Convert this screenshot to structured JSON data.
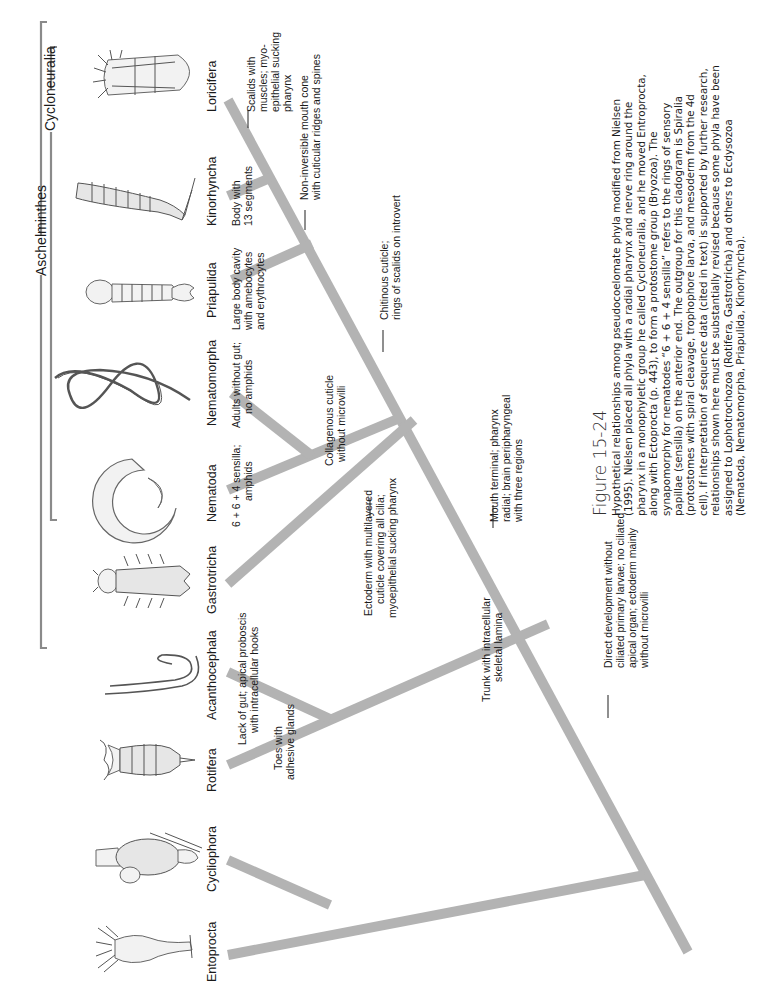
{
  "figure": {
    "number_label": "Figure 15-24",
    "caption_lines": [
      "Hypothetical relationships among pseudocoelomate phyla modified from Nielsen",
      "(1995). Nielsen placed all phyla with a radial pharynx and nerve ring around the",
      "pharynx in a monophyletic group he called Cycloneuralia, and he moved Entroprocta,",
      "along with Ectoprocta (p. 443), to form a protostome group (Bryozoa). The",
      "synapomorphy for nematodes “6 + 6 + 4 sensilla” refers to the rings of sensory",
      "papillae (sensilla) on the anterior end. The outgroup for this cladogram is Spiralia",
      "(protostomes with spiral cleavage, trophophore larva, and mesoderm from the 4d",
      "cell). If interpretation of sequence data (cited in text) is supported by further research,",
      "relationships shown here must be substantially revised because some phyla have been",
      "assigned to Lophotrochozoa (Rotifera, Gastrotricha) and others to Ecdysozoa",
      "(Nematoda, Nematomorpha, Priapulida, Kinorhyncha)."
    ]
  },
  "clades": {
    "aschelminthes": "Aschelminthes",
    "cycloneuralia": "Cycloneuralia"
  },
  "taxa": [
    {
      "name": "Entoprocta"
    },
    {
      "name": "Cycliophora"
    },
    {
      "name": "Rotifera"
    },
    {
      "name": "Acanthocephala"
    },
    {
      "name": "Gastrotricha"
    },
    {
      "name": "Nematoda"
    },
    {
      "name": "Nematomorpha"
    },
    {
      "name": "Priapulida"
    },
    {
      "name": "Kinorhyncha"
    },
    {
      "name": "Loricifera"
    }
  ],
  "characters": {
    "toes": [
      "Toes with",
      "adhesive glands"
    ],
    "lack_of_gut": [
      "Lack of gut; apical proboscis",
      "with intracellular hooks"
    ],
    "trunk": [
      "Trunk with intracellular",
      "skeletal lamina"
    ],
    "ectoderm": [
      "Ectoderm with multilayered",
      "cuticle covering all cilia;",
      "myoepithelial sucking pharynx"
    ],
    "sensilla": [
      "6 + 6 + 4 sensilla;",
      "amphids"
    ],
    "adults": [
      "Adults without gut;",
      "no amphids"
    ],
    "collagenous": [
      "Collagenous cuticle",
      "without microvilli"
    ],
    "mouth": [
      "Mouth terminal; pharynx",
      "radial; brain peripharyngeal",
      "with three regions"
    ],
    "direct": [
      "Direct development without",
      "ciliated primary larvae; no ciliated",
      "apical organ; ectoderm mainly",
      "without microvilli"
    ],
    "large_body": [
      "Large body cavity",
      "with amebocytes",
      "and erythrocytes"
    ],
    "chitinous": [
      "Chitinous cuticle;",
      "rings of scalids on introvert"
    ],
    "body13": [
      "Body with",
      "13 segments"
    ],
    "noninvert": [
      "Non-inversible mouth cone",
      "with cuticular ridges and spines"
    ],
    "scalids": [
      "Scalids with",
      "muscles; myo-",
      "epithelial sucking",
      "pharynx"
    ]
  },
  "colors": {
    "branch": "#b3b3b3",
    "bracket": "#8a8a8a",
    "text": "#1a1a1a",
    "background": "#ffffff"
  }
}
